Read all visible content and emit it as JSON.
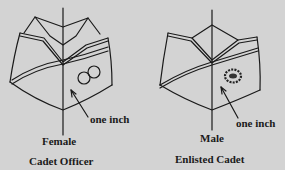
{
  "figure": {
    "background_color": "#d3d3d3",
    "line_color": "#1a1a1a",
    "panels": [
      {
        "id": "female",
        "gender_label": "Female",
        "role_label": "Cadet Officer",
        "measurement_label": "one inch",
        "insignia": "two-circles"
      },
      {
        "id": "male",
        "gender_label": "Male",
        "role_label": "Enlisted Cadet",
        "measurement_label": "one inch",
        "insignia": "wreath-emblem"
      }
    ]
  }
}
